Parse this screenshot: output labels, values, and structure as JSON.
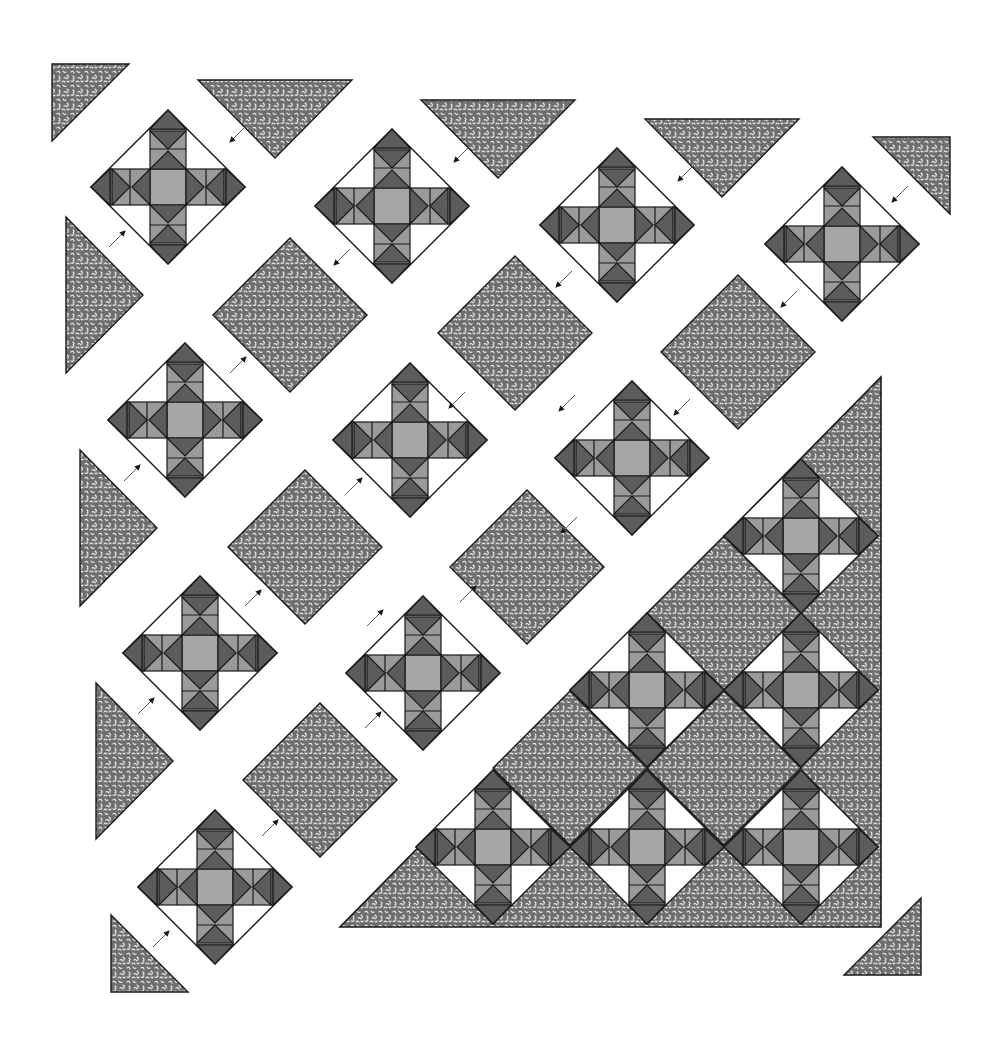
{
  "diagram": {
    "kind": "quilt-assembly-diagram",
    "colors": {
      "background": "#ffffff",
      "outline": "#1a1a1a",
      "dark": "#5c5c5c",
      "medium": "#9a9a9a",
      "light_center": "#a6a6a6",
      "white": "#ffffff",
      "print_base": "#6e6e6e",
      "print_speck": "#f2f2f2"
    },
    "block_size_half_diagonal": 77,
    "loose_blocks": [
      {
        "cx": 168,
        "cy": 187
      },
      {
        "cx": 392,
        "cy": 206
      },
      {
        "cx": 617,
        "cy": 225
      },
      {
        "cx": 842,
        "cy": 244
      },
      {
        "cx": 185,
        "cy": 420
      },
      {
        "cx": 410,
        "cy": 440
      },
      {
        "cx": 632,
        "cy": 458
      },
      {
        "cx": 200,
        "cy": 653
      },
      {
        "cx": 423,
        "cy": 673
      },
      {
        "cx": 215,
        "cy": 887
      }
    ],
    "setting_squares": [
      {
        "cx": 290,
        "cy": 315
      },
      {
        "cx": 515,
        "cy": 333
      },
      {
        "cx": 738,
        "cy": 352
      },
      {
        "cx": 305,
        "cy": 547
      },
      {
        "cx": 527,
        "cy": 567
      },
      {
        "cx": 320,
        "cy": 780
      }
    ],
    "side_triangles": [
      {
        "points": "198,80 352,80 275,158"
      },
      {
        "points": "421,100 575,100 498,178"
      },
      {
        "points": "645,119 799,119 722,197"
      },
      {
        "points": "66,217 66,373 143,295"
      },
      {
        "points": "80,450 80,606 157,528"
      },
      {
        "points": "96,683 96,839 173,761"
      }
    ],
    "corner_triangles": [
      {
        "points": "52,64 129,64 52,141"
      },
      {
        "points": "873,137 950,137 950,214"
      },
      {
        "points": "111,915 111,992 188,992"
      },
      {
        "points": "844,975 921,975 921,898"
      }
    ],
    "arrows": [
      {
        "x1": 246,
        "y1": 126,
        "x2": 230,
        "y2": 142
      },
      {
        "x1": 109,
        "y1": 247,
        "x2": 125,
        "y2": 231
      },
      {
        "x1": 470,
        "y1": 146,
        "x2": 454,
        "y2": 162
      },
      {
        "x1": 350,
        "y1": 249,
        "x2": 334,
        "y2": 265
      },
      {
        "x1": 694,
        "y1": 165,
        "x2": 678,
        "y2": 181
      },
      {
        "x1": 572,
        "y1": 271,
        "x2": 556,
        "y2": 287
      },
      {
        "x1": 908,
        "y1": 186,
        "x2": 892,
        "y2": 202
      },
      {
        "x1": 797,
        "y1": 291,
        "x2": 781,
        "y2": 307
      },
      {
        "x1": 230,
        "y1": 373,
        "x2": 246,
        "y2": 357
      },
      {
        "x1": 124,
        "y1": 481,
        "x2": 140,
        "y2": 465
      },
      {
        "x1": 465,
        "y1": 392,
        "x2": 449,
        "y2": 408
      },
      {
        "x1": 575,
        "y1": 395,
        "x2": 559,
        "y2": 411
      },
      {
        "x1": 690,
        "y1": 399,
        "x2": 674,
        "y2": 415
      },
      {
        "x1": 346,
        "y1": 494,
        "x2": 362,
        "y2": 478
      },
      {
        "x1": 577,
        "y1": 517,
        "x2": 561,
        "y2": 533
      },
      {
        "x1": 245,
        "y1": 606,
        "x2": 261,
        "y2": 590
      },
      {
        "x1": 138,
        "y1": 714,
        "x2": 154,
        "y2": 698
      },
      {
        "x1": 367,
        "y1": 626,
        "x2": 383,
        "y2": 610
      },
      {
        "x1": 460,
        "y1": 602,
        "x2": 476,
        "y2": 586
      },
      {
        "x1": 365,
        "y1": 728,
        "x2": 381,
        "y2": 712
      },
      {
        "x1": 262,
        "y1": 836,
        "x2": 278,
        "y2": 820
      },
      {
        "x1": 153,
        "y1": 947,
        "x2": 169,
        "y2": 931
      }
    ],
    "assembled_section": {
      "outline_points": "340,927 881,927 881,377",
      "blocks": [
        {
          "cx": 801,
          "cy": 536
        },
        {
          "cx": 647,
          "cy": 690
        },
        {
          "cx": 801,
          "cy": 690
        },
        {
          "cx": 493,
          "cy": 847
        },
        {
          "cx": 647,
          "cy": 847
        },
        {
          "cx": 801,
          "cy": 847
        }
      ],
      "setting_squares": [
        {
          "cx": 724,
          "cy": 613
        },
        {
          "cx": 570,
          "cy": 768
        },
        {
          "cx": 724,
          "cy": 768
        }
      ],
      "edge_triangles": [
        {
          "points": "724,536 881,379 881,536 801,459"
        },
        {
          "points": "881,536 881,690 801,613"
        },
        {
          "points": "881,690 881,847 801,768"
        },
        {
          "points": "881,847 881,927 801,927"
        },
        {
          "points": "340,927 416,849 493,927"
        },
        {
          "points": "493,927 570,849 647,927"
        },
        {
          "points": "647,927 724,849 801,927"
        }
      ]
    }
  }
}
